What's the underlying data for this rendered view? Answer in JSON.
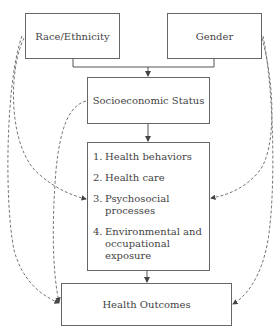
{
  "diagram": {
    "nodes": {
      "race": {
        "label": "Race/Ethnicity"
      },
      "gender": {
        "label": "Gender"
      },
      "ses": {
        "label": "Socioeconomic Status"
      },
      "mediators": {
        "items": [
          {
            "num": "1.",
            "label": "Health behaviors"
          },
          {
            "num": "2.",
            "label": "Health care"
          },
          {
            "num": "3.",
            "label": "Psychosocial processes"
          },
          {
            "num": "4.",
            "label": "Environmental and occupational exposure"
          }
        ]
      },
      "outcomes": {
        "label": "Health Outcomes"
      }
    },
    "edges": [
      {
        "from": "race+gender",
        "to": "ses",
        "style": "solid"
      },
      {
        "from": "ses",
        "to": "mediators",
        "style": "solid"
      },
      {
        "from": "mediators",
        "to": "outcomes",
        "style": "solid"
      },
      {
        "from": "race",
        "to": "mediators",
        "style": "dashed"
      },
      {
        "from": "race",
        "to": "outcomes",
        "style": "dashed"
      },
      {
        "from": "ses",
        "to": "outcomes",
        "style": "dashed"
      },
      {
        "from": "gender",
        "to": "mediators",
        "style": "dashed"
      },
      {
        "from": "gender",
        "to": "outcomes",
        "style": "dashed"
      }
    ],
    "colors": {
      "line": "#555555",
      "text": "#444444",
      "background": "#ffffff"
    }
  }
}
